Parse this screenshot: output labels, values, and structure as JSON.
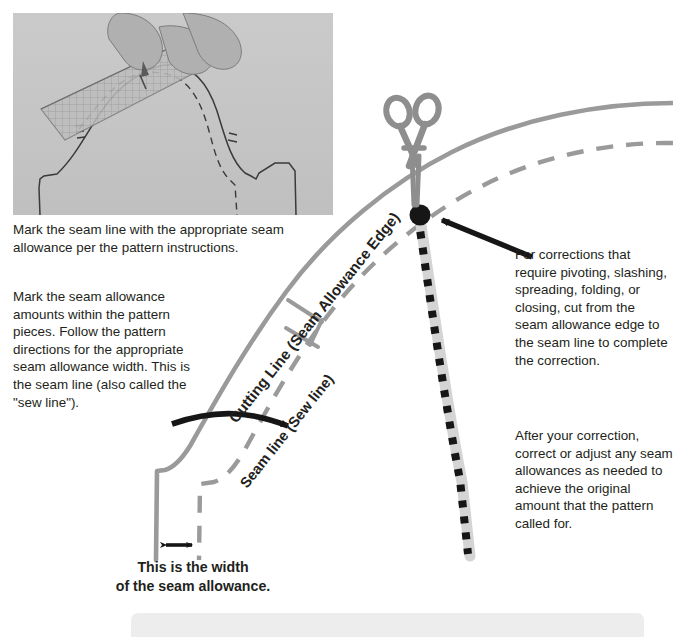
{
  "figure": {
    "type": "sewing-pattern-instructional-diagram",
    "photo": {
      "alt_name": "photo-marking-seam-line-with-ruler",
      "description": "Hand holding a pencil and a gridded transparent ruler marking a seam allowance on a paper pattern piece"
    },
    "caption_top": "Mark the seam line with the appropriate seam allowance per the pattern instructions.",
    "left_body": "Mark the seam allowance amounts within the pattern pieces. Follow the pattern directions for the appropriate seam allowance width. This is the seam line (also called the \"sew line\").",
    "right_body_1": "For corrections that require pivoting, slashing, spreading, folding, or closing, cut from the seam allowance edge to the seam line to complete the correction.",
    "right_body_2": "After your correction, correct or adjust any seam allowances as needed to achieve the original amount that the pattern called for.",
    "bottom_caption_line_1": "This is the width",
    "bottom_caption_line_2": "of the seam allowance.",
    "labels": {
      "cutting_line": "Cutting Line (Seam Allowance Edge)",
      "seam_line": "Seam line (Sew line)"
    },
    "icons": {
      "scissors": "scissors-icon",
      "cut_path": "dotted-cut-line",
      "pivot_point": "pivot-point-dot",
      "arrow_to_seam_line": "curved-arrow-icon",
      "arrow_to_pivot_point": "straight-arrow-icon",
      "width_arrow": "double-headed-arrow-icon",
      "notches": "notch-marks"
    },
    "colors": {
      "line_gray": "#9a9a9a",
      "ink_black": "#231f20",
      "scissors_gray": "#8e8e8e",
      "photo_gray": "#c9c9c9",
      "bottom_bar": "#ededed"
    }
  }
}
